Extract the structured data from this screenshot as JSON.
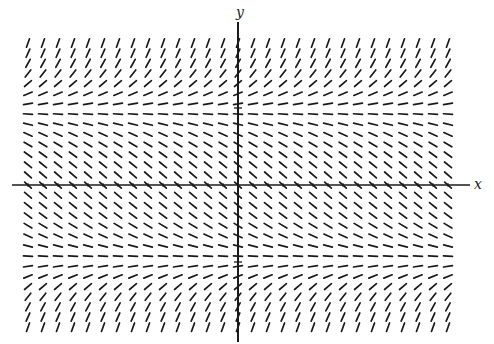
{
  "figure": {
    "type": "slope_field",
    "axis_labels": {
      "x": "x",
      "y": "y"
    },
    "colors": {
      "segments": "#1a1a1a",
      "axes": "#1a1a1a",
      "background": "#ffffff"
    }
  },
  "grid": {
    "columns": 29,
    "rows": 29,
    "x_start": 28,
    "x_step": 15,
    "y_start": 43,
    "y_step": 10.15,
    "segment_length": 9,
    "row_angles_deg": [
      70,
      66,
      61,
      52,
      40,
      22,
      9,
      -4,
      -14,
      -24,
      -31,
      -36,
      -39,
      -41,
      -42,
      -41,
      -39,
      -36,
      -31,
      -24,
      -14,
      -4,
      9,
      22,
      40,
      52,
      61,
      66,
      70
    ]
  },
  "axes": {
    "x_axis": {
      "y": 185,
      "x_from": 12,
      "x_to": 470
    },
    "y_axis": {
      "x": 238,
      "y_from": 22,
      "y_to": 342
    },
    "y_ticks": [
      108,
      262
    ],
    "x_ticks": [
      28,
      43,
      58,
      73,
      88,
      103,
      118,
      133,
      148,
      163,
      178,
      193,
      208,
      223,
      253,
      268,
      283,
      298,
      313,
      328,
      343,
      358,
      373,
      388,
      403,
      418,
      433,
      448
    ]
  }
}
